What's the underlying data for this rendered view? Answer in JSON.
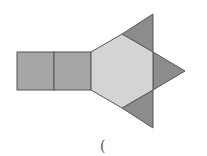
{
  "figure": {
    "colors": {
      "rectangle_fill": "#a6a6a6",
      "hexagon_fill": "#d4d4d4",
      "triangle_fill": "#8c8c8c",
      "stroke": "#555555"
    },
    "rectangles": [
      {
        "x": 17,
        "y": 52,
        "width": 37,
        "height": 38
      },
      {
        "x": 54,
        "y": 52,
        "width": 37,
        "height": 38
      }
    ],
    "hexagon": {
      "points": "91,52 122,34 153,52 153,90 122,108 91,90"
    },
    "triangles": [
      {
        "name": "top",
        "points": "122,34 153,14 153,52"
      },
      {
        "name": "right",
        "points": "153,52 185,71 153,90"
      },
      {
        "name": "bottom",
        "points": "122,108 153,128 153,90"
      }
    ]
  },
  "caption": {
    "text": "("
  }
}
